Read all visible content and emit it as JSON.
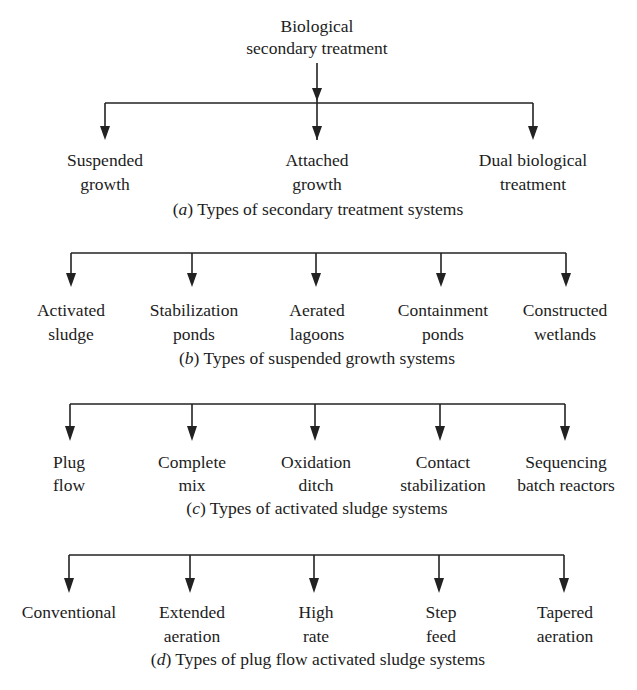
{
  "root": {
    "line1": "Biological",
    "line2": "secondary treatment"
  },
  "colors": {
    "ink": "#1c1c1c",
    "background": "#ffffff"
  },
  "panels": [
    {
      "id": "a",
      "caption_letter": "a",
      "caption_text": " Types of secondary treatment systems",
      "nodes": [
        {
          "line1": "Suspended",
          "line2": "growth"
        },
        {
          "line1": "Attached",
          "line2": "growth"
        },
        {
          "line1": "Dual biological",
          "line2": "treatment"
        }
      ]
    },
    {
      "id": "b",
      "caption_letter": "b",
      "caption_text": " Types of suspended growth systems",
      "nodes": [
        {
          "line1": "Activated",
          "line2": "sludge"
        },
        {
          "line1": "Stabilization",
          "line2": "ponds"
        },
        {
          "line1": "Aerated",
          "line2": "lagoons"
        },
        {
          "line1": "Containment",
          "line2": "ponds"
        },
        {
          "line1": "Constructed",
          "line2": "wetlands"
        }
      ]
    },
    {
      "id": "c",
      "caption_letter": "c",
      "caption_text": " Types of activated sludge systems",
      "nodes": [
        {
          "line1": "Plug",
          "line2": "flow"
        },
        {
          "line1": "Complete",
          "line2": "mix"
        },
        {
          "line1": "Oxidation",
          "line2": "ditch"
        },
        {
          "line1": "Contact",
          "line2": "stabilization"
        },
        {
          "line1": "Sequencing",
          "line2": "batch reactors"
        }
      ]
    },
    {
      "id": "d",
      "caption_letter": "d",
      "caption_text": " Types of plug flow activated sludge systems",
      "nodes": [
        {
          "line1": "Conventional",
          "line2": ""
        },
        {
          "line1": "Extended",
          "line2": "aeration"
        },
        {
          "line1": "High",
          "line2": "rate"
        },
        {
          "line1": "Step",
          "line2": "feed"
        },
        {
          "line1": "Tapered",
          "line2": "aeration"
        }
      ]
    }
  ]
}
